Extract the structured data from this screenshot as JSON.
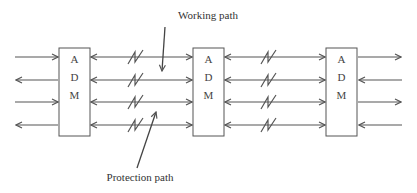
{
  "diagram": {
    "nodes": [
      {
        "id": "adm1",
        "letters": [
          "A",
          "D",
          "M"
        ],
        "x": 59,
        "y": 48,
        "w": 31,
        "h": 88
      },
      {
        "id": "adm2",
        "letters": [
          "A",
          "D",
          "M"
        ],
        "x": 193,
        "y": 48,
        "w": 31,
        "h": 88
      },
      {
        "id": "adm3",
        "letters": [
          "A",
          "D",
          "M"
        ],
        "x": 326,
        "y": 48,
        "w": 31,
        "h": 88
      }
    ],
    "line_y": [
      57,
      80,
      102,
      125
    ],
    "labels": {
      "working_path": "Working path",
      "protection_path": "Protection path"
    },
    "colors": {
      "stroke": "#555555",
      "text": "#333333",
      "background": "#ffffff"
    }
  }
}
